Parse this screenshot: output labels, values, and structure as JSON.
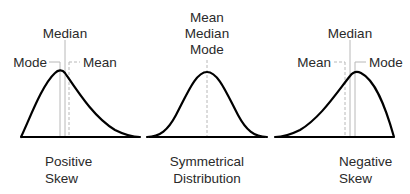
{
  "diagram": {
    "panels": [
      {
        "id": "positive",
        "caption_line1": "Positive",
        "caption_line2": "Skew",
        "labels": {
          "median": "Median",
          "mode": "Mode",
          "mean": "Mean"
        },
        "order_left_to_right": [
          "Mode",
          "Median",
          "Mean"
        ]
      },
      {
        "id": "symmetrical",
        "caption_line1": "Symmetrical",
        "caption_line2": "Distribution",
        "labels": {
          "line1": "Mean",
          "line2": "Median",
          "line3": "Mode"
        }
      },
      {
        "id": "negative",
        "caption_line1": "Negative",
        "caption_line2": "Skew",
        "labels": {
          "median": "Median",
          "mean": "Mean",
          "mode": "Mode"
        },
        "order_left_to_right": [
          "Mean",
          "Median",
          "Mode"
        ]
      }
    ],
    "colors": {
      "curve": "#000000",
      "guide": "#b8b8b8",
      "text": "#2a2a2a",
      "background": "#ffffff"
    }
  }
}
